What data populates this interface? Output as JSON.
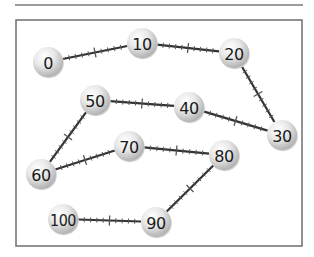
{
  "diagram": {
    "type": "number-path",
    "step_between_nodes": 10,
    "minor_ticks_per_segment": 9,
    "colors": {
      "line": "#333333",
      "tick": "#555555",
      "frame": "#6e6e6e",
      "rule": "#7a7a7a",
      "ball_highlight": "#ffffff",
      "ball_mid": "#e4e4e4",
      "ball_shadow": "#a8a8a8",
      "label": "#1a1a1a"
    },
    "top_rule": {
      "x1": 15,
      "y1": 5,
      "x2": 303,
      "y2": 5
    },
    "frame": {
      "x": 16,
      "y": 20,
      "width": 286,
      "height": 226
    },
    "node_radius": 15,
    "nodes": [
      {
        "id": "n0",
        "label": "0",
        "x": 48,
        "y": 62
      },
      {
        "id": "n10",
        "label": "10",
        "x": 142,
        "y": 43
      },
      {
        "id": "n20",
        "label": "20",
        "x": 234,
        "y": 53
      },
      {
        "id": "n30",
        "label": "30",
        "x": 282,
        "y": 135
      },
      {
        "id": "n40",
        "label": "40",
        "x": 189,
        "y": 107
      },
      {
        "id": "n50",
        "label": "50",
        "x": 95,
        "y": 100
      },
      {
        "id": "n60",
        "label": "60",
        "x": 41,
        "y": 174
      },
      {
        "id": "n70",
        "label": "70",
        "x": 129,
        "y": 146
      },
      {
        "id": "n80",
        "label": "80",
        "x": 224,
        "y": 155
      },
      {
        "id": "n90",
        "label": "90",
        "x": 156,
        "y": 222
      },
      {
        "id": "n100",
        "label": "100",
        "x": 63,
        "y": 219
      }
    ],
    "edges": [
      {
        "from": "n0",
        "to": "n10"
      },
      {
        "from": "n10",
        "to": "n20"
      },
      {
        "from": "n20",
        "to": "n30"
      },
      {
        "from": "n30",
        "to": "n40"
      },
      {
        "from": "n40",
        "to": "n50"
      },
      {
        "from": "n50",
        "to": "n60"
      },
      {
        "from": "n60",
        "to": "n70"
      },
      {
        "from": "n70",
        "to": "n80"
      },
      {
        "from": "n80",
        "to": "n90"
      },
      {
        "from": "n90",
        "to": "n100"
      }
    ]
  }
}
